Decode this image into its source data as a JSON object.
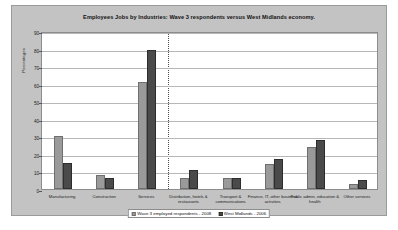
{
  "chart_data": {
    "type": "bar",
    "title": "Employees Jobs by Industries: Wave 3 respondents versus West Midlands economy.",
    "xlabel": "",
    "ylabel": "Percentages",
    "ylim": [
      0,
      90
    ],
    "yticks": [
      0,
      10,
      20,
      30,
      40,
      50,
      60,
      70,
      80,
      90
    ],
    "grid": true,
    "legend_position": "bottom",
    "categories": [
      "Manufacturing",
      "Construction",
      "Services",
      "Distribution, hotels & restaurants",
      "Transport & communications",
      "Finance, IT, other business activities",
      "Public admin, education & health",
      "Other services"
    ],
    "series": [
      {
        "name": "Wave 3 employed respondents - 2008",
        "color": "#9a9a9a",
        "values": [
          30,
          8,
          61,
          6,
          6,
          14,
          24,
          3
        ]
      },
      {
        "name": "West Midlands - 2006",
        "color": "#4a4a4a",
        "values": [
          15,
          6,
          79,
          11,
          6,
          17,
          28,
          5
        ]
      }
    ],
    "annotations": [
      {
        "type": "vertical-divider",
        "after_category": "Services",
        "style": "dotted"
      }
    ]
  },
  "corner_mark": "::"
}
